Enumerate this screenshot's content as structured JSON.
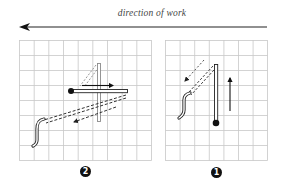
{
  "header": {
    "caption": "direction of work",
    "arrow_direction": "left"
  },
  "panels": [
    {
      "id": "panel-2",
      "label": "2",
      "position": "left",
      "grid": {
        "columns": 9,
        "rows": 8
      },
      "elements": [
        "vertical-tool-ghost",
        "horizontal-tool-with-dot",
        "motion-arrow-right",
        "dashed-stroke-trail",
        "dashed-arrow-down-left",
        "squiggle-stroke"
      ]
    },
    {
      "id": "panel-1",
      "label": "1",
      "position": "right",
      "grid": {
        "columns": 7,
        "rows": 8
      },
      "elements": [
        "vertical-tool-with-dot",
        "motion-arrow-up",
        "dashed-stroke-trail",
        "dotted-arrow-down-left",
        "squiggle-stroke"
      ]
    }
  ],
  "colors": {
    "grid": "#c8c8c8",
    "ink": "#111111",
    "ghost": "#9a9a9a",
    "background": "#ffffff"
  }
}
